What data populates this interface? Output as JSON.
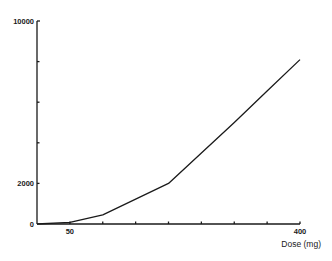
{
  "chart_data": {
    "type": "line",
    "title": "",
    "xlabel": "Dose (mg)",
    "ylabel": "",
    "xlim": [
      0,
      400
    ],
    "ylim": [
      0,
      10000
    ],
    "grid": false,
    "legend": null,
    "x_ticks": [
      50,
      100,
      150,
      200,
      250,
      300,
      350,
      400
    ],
    "x_tick_labels": [
      {
        "value": 50,
        "label": "50"
      },
      {
        "value": 400,
        "label": "400"
      }
    ],
    "y_ticks": [
      0,
      2000,
      4000,
      6000,
      8000,
      10000
    ],
    "y_tick_labels": [
      {
        "value": 10000,
        "label": "10000"
      },
      {
        "value": 2000,
        "label": "2000"
      },
      {
        "value": 0,
        "label": "0"
      }
    ],
    "series": [
      {
        "name": "response",
        "x": [
          0,
          50,
          100,
          200,
          250,
          300,
          350,
          400
        ],
        "values": [
          0,
          80,
          450,
          2000,
          3500,
          5000,
          6550,
          8100
        ]
      }
    ]
  }
}
